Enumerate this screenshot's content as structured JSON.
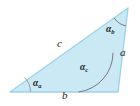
{
  "figure": {
    "kind": "geometry-diagram",
    "shape": "triangle",
    "background_color": "#ffffff",
    "fill_color": "#cbe9f5",
    "stroke_color": "#9ad4ea",
    "arc_color": "#6d6e71",
    "text_color": "#231f20",
    "vertices": [
      {
        "name": "left-vertex",
        "x": 10,
        "y": 92
      },
      {
        "name": "apex-vertex",
        "x": 128,
        "y": 8
      },
      {
        "name": "right-vertex",
        "x": 118,
        "y": 92
      }
    ],
    "sides": [
      {
        "id": "c",
        "label": "c",
        "description": "long upper-left edge from left vertex to apex"
      },
      {
        "id": "a",
        "label": "a",
        "description": "right edge from apex to right vertex"
      },
      {
        "id": "b",
        "label": "b",
        "description": "bottom edge from left vertex to right vertex"
      }
    ],
    "angles": [
      {
        "id": "alpha_a",
        "glyph": "α",
        "subscript": "a",
        "vertex": "left-vertex"
      },
      {
        "id": "alpha_b",
        "glyph": "α",
        "subscript": "b",
        "vertex": "apex-vertex"
      },
      {
        "id": "alpha_c",
        "glyph": "α",
        "subscript": "c",
        "vertex": "right-vertex"
      }
    ]
  }
}
